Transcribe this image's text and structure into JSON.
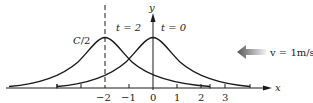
{
  "figure": {
    "type": "wave-propagation-diagram",
    "axes": {
      "x_label": "x",
      "y_label": "y",
      "x_ticks": [
        "−2",
        "−1",
        "0",
        "1",
        "2",
        "3"
      ]
    },
    "curves": [
      {
        "label": "t = 2",
        "peak_x": -2,
        "peak_label": "C/2"
      },
      {
        "label": "t = 0",
        "peak_x": 0
      }
    ],
    "annotations": {
      "peak_label": "C/2",
      "curve_t2_label": "t = 2",
      "curve_t0_label": "t = 0",
      "velocity_label": "v = 1m/s"
    },
    "arrow": {
      "direction": "left",
      "meaning": "wave velocity"
    },
    "colors": {
      "curve": "#1a1a1a",
      "axis": "#1a1a1a",
      "arrow_dark": "#555555",
      "arrow_light": "#e8e8e8"
    }
  }
}
